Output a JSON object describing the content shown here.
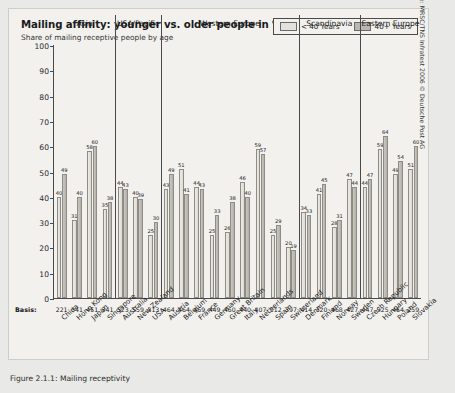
{
  "title": "Mailing affinity: younger vs. older people in %",
  "subtitle": "Share of mailing receptive people by age",
  "legend": {
    "young_label": "< 40 Years",
    "old_label": "40+ Years",
    "young_color": "#e4e2dc",
    "old_color": "#b9b7b1"
  },
  "basis_label": "Basis:",
  "source": "Source: MRSC/TNS Infratest 2006 © Deutsche Post AG",
  "caption": "Figure 2.1.1: Mailing receptivity",
  "chart_data": {
    "type": "bar",
    "title": "Mailing affinity: younger vs. older people in %",
    "subtitle": "Share of mailing receptive people by age",
    "xlabel": "",
    "ylabel": "%",
    "ylim": [
      0,
      100
    ],
    "yticks": [
      0,
      10,
      20,
      30,
      40,
      50,
      60,
      70,
      80,
      90,
      100
    ],
    "grid": false,
    "legend_position": "top-right",
    "categories": [
      "China",
      "Hong Kong",
      "Japan",
      "Singapore",
      "Australia",
      "New Zealand",
      "USA",
      "Austria",
      "Belgium",
      "France",
      "Germany",
      "Great Britain",
      "Italy",
      "Netherlands",
      "Spain",
      "Switzerland",
      "Denmark",
      "Finland",
      "Norway",
      "Sweden",
      "Czech Republic",
      "Hungary",
      "Poland",
      "Slovakia"
    ],
    "basis": [
      221,
      341,
      451,
      341,
      523,
      559,
      313,
      464,
      464,
      469,
      449,
      460,
      440,
      407,
      512,
      397,
      414,
      320,
      468,
      427,
      447,
      325,
      464,
      259,
      414
    ],
    "series": [
      {
        "name": "< 40 Years",
        "color": "#e4e2dc",
        "values": [
          40,
          31,
          58,
          35,
          44,
          40,
          25,
          43,
          51,
          44,
          25,
          26,
          46,
          59,
          25,
          20,
          34,
          41,
          28,
          47,
          44,
          59,
          49,
          51
        ]
      },
      {
        "name": "40+ Years",
        "color": "#b9b7b1",
        "values": [
          49,
          40,
          60,
          38,
          43,
          39,
          30,
          49,
          41,
          43,
          33,
          38,
          40,
          57,
          29,
          19,
          33,
          45,
          31,
          44,
          47,
          64,
          54,
          60
        ]
      }
    ],
    "groups": [
      {
        "label": "Asia",
        "start": 0,
        "end": 3
      },
      {
        "label": "USA/Pacific",
        "start": 4,
        "end": 6
      },
      {
        "label": "Western Europe",
        "start": 7,
        "end": 15
      },
      {
        "label": "Scandinavia",
        "start": 16,
        "end": 19
      },
      {
        "label": "Eastern Europe",
        "start": 20,
        "end": 23
      }
    ]
  }
}
